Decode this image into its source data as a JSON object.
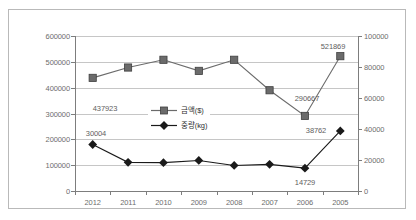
{
  "chart_data": {
    "type": "line",
    "title": "",
    "xlabel": "",
    "ylabel": "",
    "grid": true,
    "legend_position": "center",
    "categories": [
      "2012",
      "2011",
      "2010",
      "2009",
      "2008",
      "2007",
      "2006",
      "2005"
    ],
    "axes": {
      "left": {
        "label": "",
        "ylim": [
          0,
          600000
        ],
        "ticks": [
          "0",
          "100000",
          "200000",
          "300000",
          "400000",
          "500000",
          "600000"
        ],
        "tick_values": [
          0,
          100000,
          200000,
          300000,
          400000,
          500000,
          600000
        ]
      },
      "right": {
        "label": "",
        "ylim": [
          0,
          100000
        ],
        "ticks": [
          "0",
          "20000",
          "40000",
          "60000",
          "80000",
          "100000"
        ],
        "tick_values": [
          0,
          20000,
          40000,
          60000,
          80000,
          100000
        ]
      }
    },
    "series": [
      {
        "name": "금액($)",
        "axis": "left",
        "marker": "square",
        "color": "#6b6b6b",
        "values": [
          437923,
          478000,
          508000,
          465000,
          508000,
          390000,
          290667,
          521869
        ],
        "point_labels": [
          {
            "category": "2012",
            "text": "437923"
          },
          {
            "category": "2006",
            "text": "290667"
          },
          {
            "category": "2005",
            "text": "521869"
          }
        ]
      },
      {
        "name": "중량(kg)",
        "axis": "right",
        "marker": "diamond",
        "color": "#1a1a1a",
        "values": [
          30004,
          18500,
          18300,
          19700,
          16500,
          17200,
          14729,
          38762
        ],
        "point_labels": [
          {
            "category": "2012",
            "text": "30004"
          },
          {
            "category": "2006",
            "text": "14729"
          },
          {
            "category": "2005",
            "text": "38762"
          }
        ]
      }
    ],
    "legend": [
      {
        "label": "금액($)",
        "marker": "square"
      },
      {
        "label": "중량(kg)",
        "marker": "diamond"
      }
    ],
    "colors": {
      "amount_series": "#6b6b6b",
      "weight_series": "#1a1a1a",
      "gridline": "#c6c6c6",
      "axis": "#7d7d7d",
      "tick_text": "#6d6d6d",
      "frame": "#b9b9b9",
      "background": "#ffffff"
    }
  }
}
